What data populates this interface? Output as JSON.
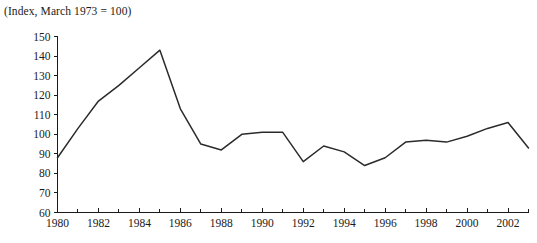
{
  "chart_data": {
    "type": "line",
    "title": "",
    "note": "(Index, March 1973 = 100)",
    "xlabel": "",
    "ylabel": "",
    "xlim": [
      1980,
      2003
    ],
    "ylim": [
      60,
      150
    ],
    "ytick_step": 10,
    "grid": false,
    "legend": null,
    "yticks": [
      60,
      70,
      80,
      90,
      100,
      110,
      120,
      130,
      140,
      150
    ],
    "ytick_labels": [
      "60",
      "70",
      "80",
      "90",
      "100",
      "110",
      "120",
      "130",
      "140",
      "150"
    ],
    "xticks_major": [
      1980,
      1982,
      1984,
      1986,
      1988,
      1990,
      1992,
      1994,
      1996,
      1998,
      2000,
      2002
    ],
    "xtick_labels": [
      "1980",
      "1982",
      "1984",
      "1986",
      "1988",
      "1990",
      "1992",
      "1994",
      "1996",
      "1998",
      "2000",
      "2002"
    ],
    "xticks_minor": [
      1981,
      1983,
      1985,
      1987,
      1989,
      1991,
      1993,
      1995,
      1997,
      1999,
      2001,
      2003
    ],
    "series": [
      {
        "name": "Index",
        "color": "#2b2b2b",
        "x": [
          1980,
          1981,
          1982,
          1983,
          1984,
          1985,
          1986,
          1987,
          1988,
          1989,
          1990,
          1991,
          1992,
          1993,
          1994,
          1995,
          1996,
          1997,
          1998,
          1999,
          2000,
          2001,
          2002,
          2003
        ],
        "values": [
          88,
          103,
          117,
          125,
          134,
          143,
          113,
          95,
          92,
          100,
          101,
          101,
          86,
          94,
          91,
          84,
          88,
          96,
          97,
          96,
          99,
          103,
          106,
          93
        ]
      }
    ]
  }
}
